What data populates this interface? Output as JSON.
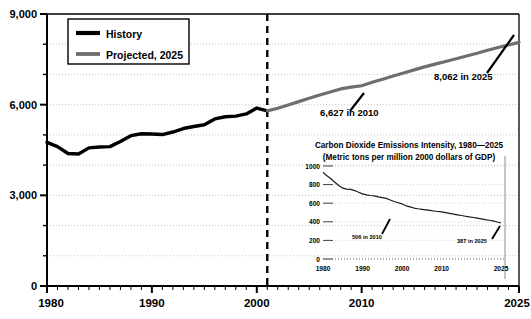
{
  "chart_data": {
    "type": "line",
    "title": "",
    "xlabel": "",
    "ylabel": "",
    "xlim": [
      1980,
      2025
    ],
    "ylim": [
      0,
      9000
    ],
    "grid": true,
    "yticks": [
      0,
      3000,
      6000,
      9000
    ],
    "ytick_labels": [
      "0",
      "3,000",
      "6,000",
      "9,000"
    ],
    "yminor_step": 1000,
    "xticks": [
      1980,
      1990,
      2000,
      2010,
      2025
    ],
    "xtick_labels": [
      "1980",
      "1990",
      "2000",
      "2010",
      "2025"
    ],
    "divider_year": 2001,
    "legend": {
      "position": "top-left",
      "entries": [
        {
          "label": "History",
          "color": "#000000"
        },
        {
          "label": "Projected, 2025",
          "color": "#6e6e6e"
        }
      ]
    },
    "annotations": [
      {
        "text": "6,627 in 2010",
        "x": 2010,
        "y": 6627
      },
      {
        "text": "8,062 in 2025",
        "x": 2025,
        "y": 8062
      }
    ],
    "series": [
      {
        "name": "History",
        "color": "#000000",
        "x": [
          1980,
          1981,
          1982,
          1983,
          1984,
          1985,
          1986,
          1987,
          1988,
          1989,
          1990,
          1991,
          1992,
          1993,
          1994,
          1995,
          1996,
          1997,
          1998,
          1999,
          2000,
          2001
        ],
        "values": [
          4754,
          4610,
          4384,
          4368,
          4571,
          4601,
          4611,
          4780,
          4973,
          5039,
          5030,
          5012,
          5095,
          5210,
          5278,
          5337,
          5528,
          5599,
          5620,
          5694,
          5888,
          5796
        ]
      },
      {
        "name": "Projected, 2025",
        "color": "#6e6e6e",
        "x": [
          2001,
          2002,
          2003,
          2004,
          2005,
          2006,
          2007,
          2008,
          2009,
          2010,
          2011,
          2012,
          2013,
          2014,
          2015,
          2016,
          2017,
          2018,
          2019,
          2020,
          2021,
          2022,
          2023,
          2024,
          2025
        ],
        "values": [
          5796,
          5880,
          5990,
          6100,
          6210,
          6320,
          6420,
          6520,
          6580,
          6627,
          6740,
          6840,
          6950,
          7050,
          7150,
          7250,
          7340,
          7430,
          7520,
          7610,
          7700,
          7800,
          7890,
          7975,
          8062
        ]
      }
    ]
  },
  "inset_chart_data": {
    "type": "line",
    "title": "Carbon Dioxide Emissions Intensity, 1980—2025",
    "subtitle": "(Metric tons per million 2000 dollars of GDP)",
    "xlabel": "",
    "ylabel": "",
    "xlim": [
      1980,
      2025
    ],
    "ylim": [
      0,
      1000
    ],
    "grid": true,
    "yticks": [
      0,
      200,
      400,
      600,
      800,
      1000
    ],
    "ytick_labels": [
      "0",
      "200",
      "400",
      "600",
      "800",
      "1000"
    ],
    "xticks": [
      1980,
      1990,
      2000,
      2010,
      2025
    ],
    "xtick_labels": [
      "1980",
      "1990",
      "2000",
      "2010",
      "2025"
    ],
    "annotations": [
      {
        "text": "506 in 2010",
        "x": 2010,
        "y": 506
      },
      {
        "text": "387 in 2025",
        "x": 2025,
        "y": 387
      }
    ],
    "series": [
      {
        "name": "Intensity",
        "color": "#1a1a1a",
        "x": [
          1980,
          1981,
          1982,
          1983,
          1984,
          1985,
          1986,
          1987,
          1988,
          1989,
          1990,
          1991,
          1992,
          1993,
          1994,
          1995,
          1996,
          1997,
          1998,
          1999,
          2000,
          2001,
          2002,
          2003,
          2004,
          2005,
          2006,
          2007,
          2008,
          2009,
          2010,
          2011,
          2012,
          2013,
          2014,
          2015,
          2016,
          2017,
          2018,
          2019,
          2020,
          2021,
          2022,
          2023,
          2024,
          2025
        ],
        "values": [
          930,
          895,
          862,
          826,
          790,
          762,
          752,
          748,
          736,
          718,
          700,
          690,
          683,
          679,
          668,
          660,
          652,
          634,
          618,
          605,
          592,
          572,
          560,
          548,
          540,
          534,
          528,
          522,
          516,
          511,
          506,
          498,
          490,
          482,
          475,
          468,
          460,
          452,
          446,
          439,
          432,
          424,
          417,
          410,
          398,
          387
        ]
      }
    ]
  }
}
